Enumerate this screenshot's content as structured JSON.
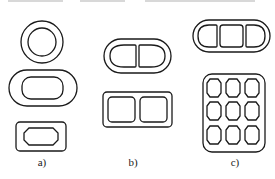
{
  "figure": {
    "panels": [
      {
        "id": "a",
        "label": "a)",
        "shapes": [
          "single circular cavity",
          "single oval (stadium) cavity",
          "single octagonal cavity in rectangle"
        ]
      },
      {
        "id": "b",
        "label": "b)",
        "shapes": [
          "two-cavity stadium",
          "two-cavity rounded rectangle"
        ]
      },
      {
        "id": "c",
        "label": "c)",
        "shapes": [
          "three-cavity stadium",
          "3x3 nine-cavity rounded rectangle"
        ]
      }
    ],
    "stroke_color": "#1a1a1a",
    "background": "#ffffff"
  }
}
